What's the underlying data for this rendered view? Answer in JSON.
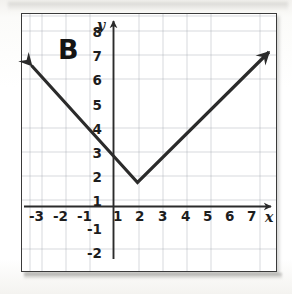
{
  "figure": {
    "panel_label": "B",
    "x_axis_name": "x",
    "y_axis_name": "y"
  },
  "chart_data": {
    "type": "line",
    "title": "B",
    "xlabel": "x",
    "ylabel": "y",
    "grid": true,
    "legend": "none",
    "xlim": [
      -3.8,
      7.5
    ],
    "ylim": [
      -2.8,
      8.7
    ],
    "x_ticks": [
      -3,
      -2,
      -1,
      1,
      2,
      3,
      4,
      5,
      6,
      7
    ],
    "y_ticks": [
      -2,
      -1,
      1,
      2,
      3,
      4,
      5,
      6,
      7,
      8
    ],
    "x_tick_labels": [
      "-3",
      "-2",
      "-1",
      "1",
      "2",
      "3",
      "4",
      "5",
      "6",
      "7"
    ],
    "y_tick_labels": [
      "-2",
      "-1",
      "1",
      "2",
      "3",
      "4",
      "5",
      "6",
      "7",
      "8"
    ],
    "series": [
      {
        "name": "absolute value function",
        "equation": "y = |x - 1| + 1",
        "vertex": [
          1,
          1
        ],
        "arrows": [
          "start",
          "end"
        ],
        "x": [
          -3.8,
          1,
          7.5
        ],
        "values": [
          5.8,
          1,
          7.5
        ],
        "points": [
          [
            -3.8,
            5.8
          ],
          [
            -2,
            4
          ],
          [
            -1,
            3
          ],
          [
            0,
            2
          ],
          [
            1,
            1
          ],
          [
            2,
            2
          ],
          [
            3,
            3
          ],
          [
            4,
            4
          ],
          [
            5,
            5
          ],
          [
            6,
            6
          ],
          [
            7,
            7
          ],
          [
            7.5,
            7.5
          ]
        ]
      }
    ],
    "colors": {
      "curve": "#2b2b2b",
      "axis": "#2b2b2b",
      "grid": "#9aa0ab",
      "frame": "#3a3a3a",
      "background": "#ffffff"
    }
  }
}
